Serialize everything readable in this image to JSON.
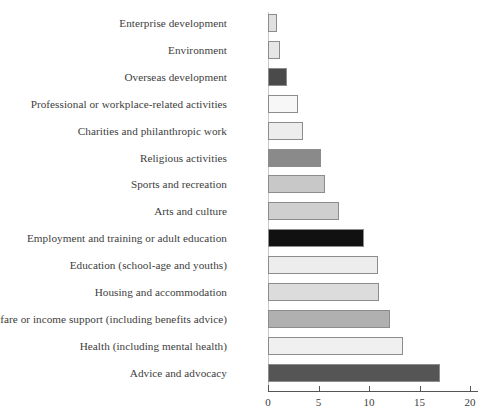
{
  "chart_data": {
    "type": "bar",
    "orientation": "horizontal",
    "title": "",
    "subtitle": "",
    "xlabel": "",
    "ylabel": "",
    "xlim": [
      0,
      21
    ],
    "grid": false,
    "legend": "none",
    "xticks": [
      "0",
      "5",
      "10",
      "15",
      "20"
    ],
    "xtick_values": [
      0,
      5,
      10,
      15,
      20
    ],
    "categories": [
      "Enterprise development",
      "Environment",
      "Overseas development",
      "Professional or workplace-related activities",
      "Charities and philanthropic work",
      "Religious activities",
      "Sports and recreation",
      "Arts and culture",
      "Employment and training or adult education",
      "Education (school-age and youths)",
      "Housing and accommodation",
      "Welfare or income support (including benefits advice)",
      "Health (including mental health)",
      "Advice and advocacy"
    ],
    "values": [
      0.9,
      1.2,
      1.9,
      3.0,
      3.5,
      5.2,
      5.6,
      7.0,
      9.5,
      10.9,
      11.0,
      12.1,
      13.4,
      17.0
    ],
    "bar_colors": [
      "#e0e0e0",
      "#e6e6e6",
      "#4a4a4a",
      "#f7f7f7",
      "#ededed",
      "#8a8a8a",
      "#c8c8c8",
      "#cfcfcf",
      "#111111",
      "#ededed",
      "#dcdcdc",
      "#b0b0b0",
      "#f0f0f0",
      "#555555"
    ],
    "bar_edge_color": "#8c8c8c",
    "axis_color": "#555555",
    "text_color": "#3d3d3d",
    "background": "#ffffff"
  }
}
